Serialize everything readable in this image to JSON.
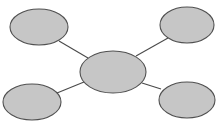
{
  "diagram": {
    "type": "spider-map",
    "colors": {
      "background": "#ffffff",
      "node_fill": "#c6c6c6",
      "node_stroke": "#505050",
      "connector": "#4a4a4a"
    },
    "center_node": {
      "id": "center",
      "label": "",
      "cx": 113,
      "cy": 72,
      "rx": 33,
      "ry": 21
    },
    "outer_nodes": [
      {
        "id": "top-left",
        "label": "",
        "cx": 39,
        "cy": 27,
        "rx": 29,
        "ry": 18
      },
      {
        "id": "top-right",
        "label": "",
        "cx": 187,
        "cy": 25,
        "rx": 27,
        "ry": 18
      },
      {
        "id": "bottom-left",
        "label": "",
        "cx": 32,
        "cy": 102,
        "rx": 29,
        "ry": 18
      },
      {
        "id": "bottom-right",
        "label": "",
        "cx": 187,
        "cy": 100,
        "rx": 28,
        "ry": 18
      }
    ],
    "connectors": [
      {
        "from": "top-left",
        "to": "center",
        "x1": 59,
        "y1": 41,
        "x2": 88,
        "y2": 58
      },
      {
        "from": "top-right",
        "to": "center",
        "x1": 168,
        "y1": 38,
        "x2": 136,
        "y2": 56
      },
      {
        "from": "bottom-left",
        "to": "center",
        "x1": 57,
        "y1": 93,
        "x2": 84,
        "y2": 82
      },
      {
        "from": "bottom-right",
        "to": "center",
        "x1": 161,
        "y1": 89,
        "x2": 142,
        "y2": 83
      }
    ]
  }
}
